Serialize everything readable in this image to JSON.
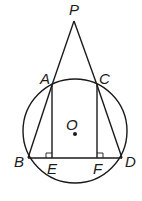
{
  "diagram": {
    "type": "geometry",
    "stroke_color": "#1a1a1a",
    "circle": {
      "center_label": "O",
      "cx": 75,
      "cy": 131,
      "r": 52
    },
    "points": {
      "P": {
        "label": "P",
        "x": 74,
        "y": 21
      },
      "A": {
        "label": "A",
        "x": 52,
        "y": 85
      },
      "C": {
        "label": "C",
        "x": 97,
        "y": 85
      },
      "B": {
        "label": "B",
        "x": 28,
        "y": 158
      },
      "D": {
        "label": "D",
        "x": 122,
        "y": 158
      },
      "E": {
        "label": "E",
        "x": 52,
        "y": 158
      },
      "F": {
        "label": "F",
        "x": 97,
        "y": 158
      },
      "O": {
        "label": "O",
        "x": 75,
        "y": 134
      }
    },
    "segments": [
      [
        "P",
        "A"
      ],
      [
        "A",
        "B"
      ],
      [
        "P",
        "C"
      ],
      [
        "C",
        "D"
      ],
      [
        "A",
        "E"
      ],
      [
        "C",
        "F"
      ],
      [
        "B",
        "D"
      ]
    ],
    "right_angles": [
      "E",
      "F"
    ]
  }
}
